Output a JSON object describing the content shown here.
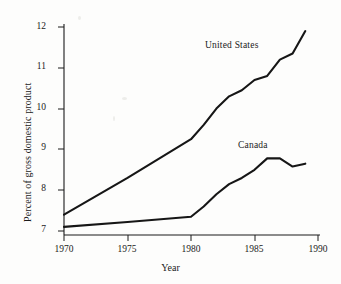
{
  "chart_data": {
    "type": "line",
    "title": "",
    "xlabel": "Year",
    "ylabel": "Percent of gross domestic product",
    "xlim": [
      1969,
      1991
    ],
    "ylim": [
      6.6,
      12.25
    ],
    "xticks": [
      1970,
      1975,
      1980,
      1985,
      1990
    ],
    "yticks": [
      7,
      8,
      9,
      10,
      11,
      12
    ],
    "xtick_labels": [
      "1970",
      "1975",
      "1980",
      "1985",
      "1990"
    ],
    "ytick_labels": [
      "7",
      "8",
      "9",
      "10",
      "11",
      "12"
    ],
    "grid": false,
    "legend_position": "inline-annotation",
    "line_color": "#161616",
    "background_color": "#fdfdfc",
    "series": [
      {
        "name": "United States",
        "label_position": {
          "x": 1983.0,
          "y": 11.45
        },
        "x": [
          1970,
          1975,
          1980,
          1981,
          1982,
          1983,
          1984,
          1985,
          1986,
          1987,
          1988,
          1989
        ],
        "values": [
          7.4,
          8.3,
          9.25,
          9.6,
          10.0,
          10.3,
          10.45,
          10.7,
          10.8,
          11.2,
          11.35,
          11.9
        ]
      },
      {
        "name": "Canada",
        "label_position": {
          "x": 1985.6,
          "y": 9.08
        },
        "x": [
          1970,
          1975,
          1980,
          1981,
          1982,
          1983,
          1984,
          1985,
          1986,
          1987,
          1988,
          1989
        ],
        "values": [
          7.1,
          7.22,
          7.35,
          7.6,
          7.9,
          8.15,
          8.3,
          8.5,
          8.78,
          8.78,
          8.58,
          8.65
        ]
      }
    ]
  },
  "annotations": {
    "united_states_label": "United States",
    "canada_label": "Canada"
  },
  "axes": {
    "x_title": "Year",
    "y_title": "Percent of gross domestic product"
  }
}
